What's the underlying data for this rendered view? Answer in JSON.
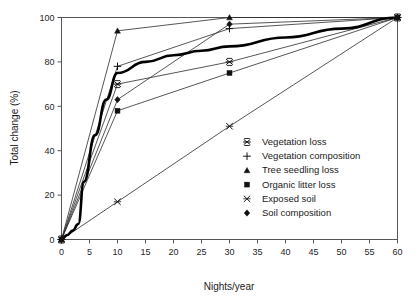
{
  "chart_data": {
    "type": "line",
    "title": "",
    "xlabel": "Nights/year",
    "ylabel": "Total change (%)",
    "xlim": [
      0,
      60
    ],
    "ylim": [
      0,
      100
    ],
    "xticks": [
      0,
      5,
      10,
      15,
      20,
      25,
      30,
      35,
      40,
      45,
      50,
      55,
      60
    ],
    "yticks": [
      0,
      20,
      40,
      60,
      80,
      100
    ],
    "grid": false,
    "legend_position": "center-right-inside",
    "x": [
      0,
      10,
      30,
      60
    ],
    "series": [
      {
        "name": "Vegetation loss",
        "marker": "star",
        "values": [
          0,
          70,
          80,
          100
        ]
      },
      {
        "name": "Vegetation composition",
        "marker": "plus",
        "values": [
          0,
          78,
          95,
          100
        ]
      },
      {
        "name": "Tree seedling loss",
        "marker": "triangle",
        "values": [
          0,
          94,
          100,
          100
        ]
      },
      {
        "name": "Organic litter loss",
        "marker": "square",
        "values": [
          0,
          58,
          75,
          100
        ]
      },
      {
        "name": "Exposed soil",
        "marker": "cross",
        "values": [
          0,
          17,
          51,
          100
        ]
      },
      {
        "name": "Soil composition",
        "marker": "diamond",
        "values": [
          0,
          63,
          97,
          100
        ]
      }
    ],
    "mean_curve": {
      "name": "Mean total change",
      "marker": "none",
      "emphasis": "bold",
      "x": [
        0,
        1,
        2,
        3,
        4,
        6,
        8,
        10,
        15,
        20,
        25,
        30,
        40,
        50,
        60
      ],
      "values": [
        0,
        2,
        4,
        7,
        26,
        47,
        63,
        75,
        80,
        83,
        85,
        87,
        91,
        95,
        100
      ]
    },
    "xtick_labels": [
      "0",
      "5",
      "10",
      "15",
      "20",
      "25",
      "30",
      "35",
      "40",
      "45",
      "50",
      "55",
      "60"
    ],
    "ytick_labels": [
      "0",
      "20",
      "40",
      "60",
      "80",
      "100"
    ],
    "legend_entries": [
      "Vegetation loss",
      "Vegetation composition",
      "Tree seedling loss",
      "Organic litter loss",
      "Exposed soil",
      "Soil composition"
    ]
  },
  "colors": {
    "line": "#2b2b2b",
    "mean_line": "#000000",
    "marker": "#111111",
    "frame": "#555555",
    "background": "#ffffff",
    "text": "#1a1a1a"
  }
}
